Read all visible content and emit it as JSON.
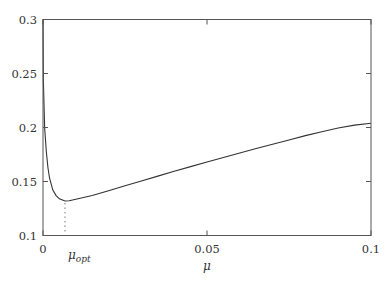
{
  "chart_data": {
    "type": "line",
    "title": "",
    "xlabel": "μ",
    "ylabel": "",
    "xlim": [
      0,
      0.1
    ],
    "ylim": [
      0.1,
      0.3
    ],
    "grid": false,
    "legend": null,
    "x_ticks": [
      {
        "value": 0,
        "label": "0"
      },
      {
        "value": 0.05,
        "label": "0.05"
      },
      {
        "value": 0.1,
        "label": "0.1"
      }
    ],
    "y_ticks": [
      {
        "value": 0.1,
        "label": "0.1"
      },
      {
        "value": 0.15,
        "label": "0.15"
      },
      {
        "value": 0.2,
        "label": "0.2"
      },
      {
        "value": 0.25,
        "label": "0.25"
      },
      {
        "value": 0.3,
        "label": "0.3"
      }
    ],
    "series": [
      {
        "name": "curve",
        "color": "#333333",
        "x": [
          0.0001,
          0.0005,
          0.001,
          0.0015,
          0.002,
          0.003,
          0.004,
          0.005,
          0.0067,
          0.008,
          0.01,
          0.015,
          0.02,
          0.025,
          0.03,
          0.035,
          0.04,
          0.045,
          0.05,
          0.055,
          0.06,
          0.065,
          0.07,
          0.075,
          0.08,
          0.085,
          0.09,
          0.095,
          0.1
        ],
        "y": [
          0.245,
          0.2,
          0.178,
          0.163,
          0.153,
          0.142,
          0.137,
          0.134,
          0.132,
          0.1322,
          0.1335,
          0.137,
          0.1415,
          0.146,
          0.1505,
          0.155,
          0.1595,
          0.1638,
          0.168,
          0.1722,
          0.1764,
          0.1805,
          0.1845,
          0.1885,
          0.1925,
          0.196,
          0.1995,
          0.2022,
          0.204
        ]
      }
    ],
    "annotations": [
      {
        "type": "vline-dotted",
        "x": 0.0067,
        "from_y": 0.1,
        "to_y": 0.132,
        "label": "μ_opt"
      }
    ]
  },
  "labels": {
    "x_axis": "μ",
    "mu_opt_base": "μ",
    "mu_opt_sub": "opt"
  }
}
